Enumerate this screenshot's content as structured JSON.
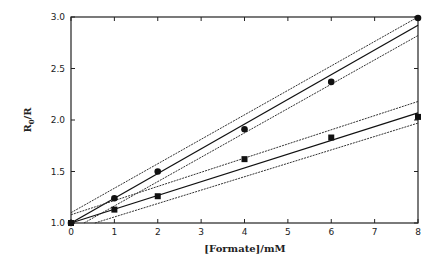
{
  "chart_data": {
    "type": "scatter",
    "title": "",
    "xlabel": "[Formate]/mM",
    "ylabel": "R0/R",
    "ylabel_main": "R",
    "ylabel_sub": "0",
    "ylabel_tail": "/R",
    "xlim": [
      0,
      8
    ],
    "ylim": [
      1.0,
      3.0
    ],
    "xticks": [
      0,
      1,
      2,
      3,
      4,
      5,
      6,
      7,
      8
    ],
    "yticks": [
      1.0,
      1.5,
      2.0,
      2.5,
      3.0
    ],
    "ytick_labels": [
      "1.0",
      "1.5",
      "2.0",
      "2.5",
      "3.0"
    ],
    "grid": false,
    "legend": null,
    "series": [
      {
        "name": "circles",
        "marker": "circle",
        "x": [
          0,
          1,
          2,
          4,
          6,
          8
        ],
        "y": [
          1.0,
          1.24,
          1.5,
          1.91,
          2.37,
          2.99
        ],
        "fit": {
          "x": [
            0,
            8
          ],
          "y": [
            1.0,
            2.92
          ]
        },
        "ci_upper": {
          "x": [
            0,
            8
          ],
          "y": [
            1.1,
            3.0
          ]
        },
        "ci_lower": {
          "x": [
            0.3,
            8
          ],
          "y": [
            1.0,
            2.82
          ]
        }
      },
      {
        "name": "squares",
        "marker": "square",
        "x": [
          0,
          1,
          2,
          4,
          6,
          8
        ],
        "y": [
          1.0,
          1.13,
          1.26,
          1.62,
          1.83,
          2.03
        ],
        "fit": {
          "x": [
            0,
            8
          ],
          "y": [
            1.0,
            2.07
          ]
        },
        "ci_upper": {
          "x": [
            0,
            8
          ],
          "y": [
            1.08,
            2.18
          ]
        },
        "ci_lower": {
          "x": [
            0.55,
            8
          ],
          "y": [
            1.0,
            1.97
          ]
        }
      }
    ]
  }
}
